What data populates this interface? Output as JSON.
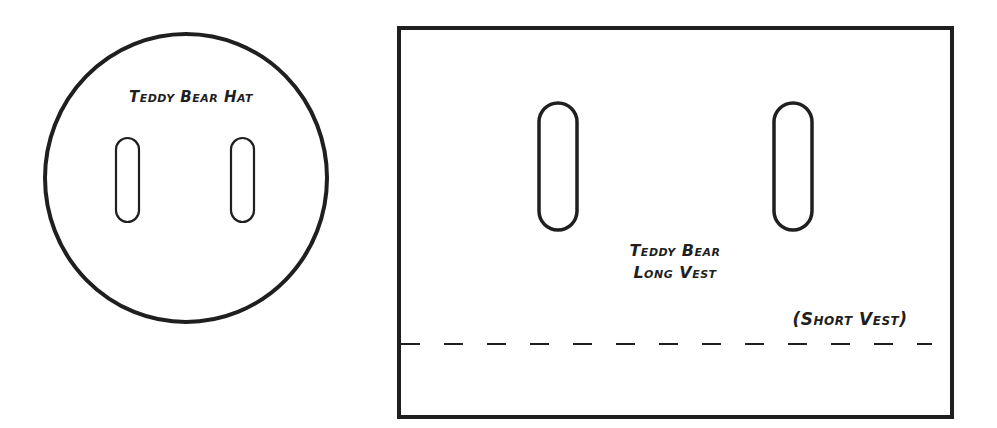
{
  "hat_pattern": {
    "title": "Teddy Bear Hat",
    "shape": "circle",
    "slots": 2
  },
  "vest_pattern": {
    "title_line1": "Teddy Bear",
    "title_line2": "Long Vest",
    "shape": "rectangle",
    "slots": 2,
    "cut_line_label": "(Short Vest)",
    "cut_line_style": "dashed"
  },
  "colors": {
    "ink": "#1f1f1f",
    "paper": "#ffffff"
  }
}
